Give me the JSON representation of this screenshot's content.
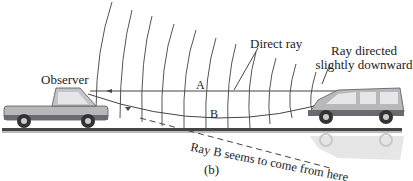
{
  "figure": {
    "caption": "(b)"
  },
  "labels": {
    "observer": "Observer",
    "direct_ray": "Direct ray",
    "ray_downward": "Ray directed slightly downward",
    "ray_a": "A",
    "ray_b": "B",
    "apparent_source": "Ray B seems to come from here"
  },
  "objects": {
    "observer_vehicle": "pickup-truck",
    "source_vehicle": "minivan",
    "reflection": "inverted-minivan-image"
  },
  "colors": {
    "ink": "#333333",
    "vehicle_body": "#b8b8bc",
    "vehicle_dark": "#6a6a70",
    "road": "#444444",
    "reflection": "#d9d9dc"
  }
}
